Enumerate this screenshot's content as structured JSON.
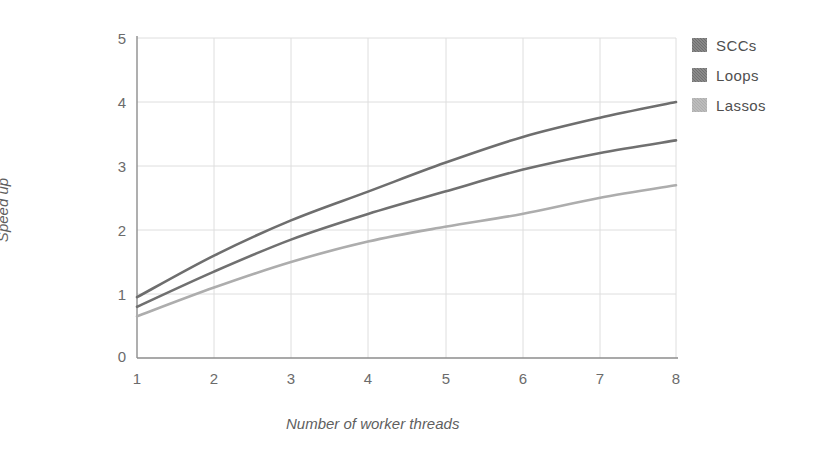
{
  "chart_data": {
    "type": "line",
    "title": "",
    "xlabel": "Number of worker threads",
    "ylabel": "Speed up",
    "xlim": [
      1,
      8
    ],
    "ylim": [
      0,
      5
    ],
    "xticks": [
      "1",
      "2",
      "3",
      "4",
      "5",
      "6",
      "7",
      "8"
    ],
    "yticks": [
      "0",
      "1",
      "2",
      "3",
      "4",
      "5"
    ],
    "grid": true,
    "legend_position": "right",
    "x": [
      1,
      2,
      3,
      4,
      5,
      6,
      7,
      8
    ],
    "series": [
      {
        "name": "SCCs",
        "color": "#6e6e6e",
        "values": [
          0.95,
          1.6,
          2.15,
          2.6,
          3.05,
          3.45,
          3.75,
          4.0
        ]
      },
      {
        "name": "Loops",
        "color": "#707070",
        "values": [
          0.8,
          1.35,
          1.85,
          2.25,
          2.6,
          2.94,
          3.2,
          3.4
        ]
      },
      {
        "name": "Lassos",
        "color": "#adadad",
        "values": [
          0.65,
          1.1,
          1.5,
          1.82,
          2.05,
          2.25,
          2.5,
          2.7
        ]
      }
    ]
  },
  "legend": {
    "items": [
      {
        "label": "SCCs",
        "color": "#6e6e6e"
      },
      {
        "label": "Loops",
        "color": "#707070"
      },
      {
        "label": "Lassos",
        "color": "#adadad"
      }
    ]
  },
  "axes": {
    "y_title": "Speed up",
    "x_title": "Number of worker threads",
    "y_tick_labels": [
      "5",
      "4",
      "3",
      "2",
      "1",
      "0"
    ],
    "x_tick_labels": [
      "1",
      "2",
      "3",
      "4",
      "5",
      "6",
      "7",
      "8"
    ]
  },
  "style": {
    "axis_color": "#8d8d8d",
    "grid_color": "#dcdcdc",
    "background": "#ffffff",
    "text_color": "#6b6b6b"
  }
}
